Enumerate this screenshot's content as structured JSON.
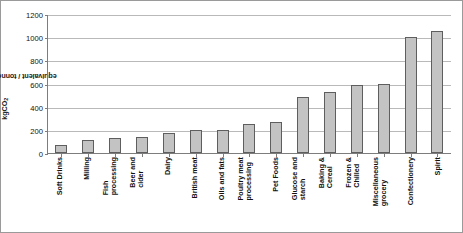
{
  "chart_data": {
    "type": "bar",
    "title": "",
    "xlabel": "",
    "ylabel": "kgCO2 equivalent / tonne product",
    "ylabel_parts": {
      "pre": "kgCO",
      "sub": "2",
      "post": " equivalent / tonne product"
    },
    "ylim": [
      0,
      1200
    ],
    "ytick_values": [
      0,
      200,
      400,
      600,
      800,
      1000,
      1200
    ],
    "ytick_labels": [
      "0",
      "200",
      "400",
      "600",
      "800",
      "1000",
      "1200"
    ],
    "grid": true,
    "legend": "none",
    "bar_color": "#c3c3c3",
    "bar_edge_color": "#5e5e5e",
    "categories": [
      "Soft Drinks",
      "Milling",
      "Fish processing",
      "Beer and cider",
      "Dairy",
      "British meat",
      "Oils and fats",
      "Poultry meat processing",
      "Pet Foods",
      "Glucose and starch",
      "Baking & Cereal",
      "Frozen & Chilled",
      "Miscellaneous grocery",
      "Confectionery",
      "Spirit"
    ],
    "category_lines": [
      [
        "Soft Drinks"
      ],
      [
        "Milling"
      ],
      [
        "Fish",
        "processing"
      ],
      [
        "Beer and",
        "cider"
      ],
      [
        "Dairy"
      ],
      [
        "British meat"
      ],
      [
        "Oils and fats"
      ],
      [
        "Poultry meat",
        "processing"
      ],
      [
        "Pet Foods"
      ],
      [
        "Glucose and",
        "starch"
      ],
      [
        "Baking &",
        "Cereal"
      ],
      [
        "Frozen &",
        "Chilled"
      ],
      [
        "Miscellaneous",
        "grocery"
      ],
      [
        "Confectionery"
      ],
      [
        "Spirit"
      ]
    ],
    "values": [
      70,
      110,
      130,
      140,
      170,
      200,
      200,
      250,
      270,
      480,
      525,
      590,
      600,
      1000,
      1050
    ]
  }
}
